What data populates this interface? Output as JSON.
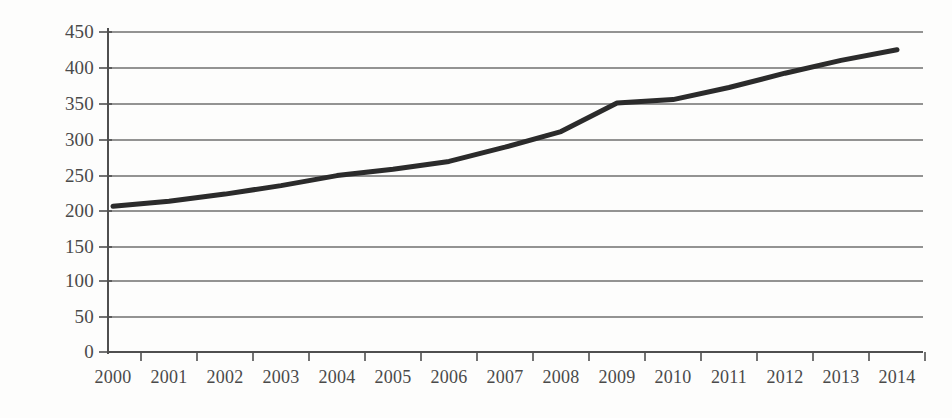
{
  "chart_data": {
    "type": "line",
    "title": "",
    "subtitle": "",
    "xlabel": "",
    "ylabel": "",
    "categories": [
      "2000",
      "2001",
      "2002",
      "2003",
      "2004",
      "2005",
      "2006",
      "2007",
      "2008",
      "2009",
      "2010",
      "2011",
      "2012",
      "2013",
      "2014"
    ],
    "values": [
      205,
      212,
      222,
      234,
      248,
      257,
      268,
      288,
      310,
      350,
      355,
      372,
      392,
      410,
      425
    ],
    "series": [
      {
        "name": "",
        "values": [
          205,
          212,
          222,
          234,
          248,
          257,
          268,
          288,
          310,
          350,
          355,
          372,
          392,
          410,
          425
        ]
      }
    ],
    "ylim": [
      0,
      450
    ],
    "ytick_values": [
      0,
      50,
      100,
      150,
      200,
      250,
      300,
      350,
      400,
      450
    ],
    "ytick_labels": [
      "0",
      "50",
      "100",
      "150",
      "200",
      "250",
      "300",
      "350",
      "400",
      "450"
    ],
    "xtick_labels": [
      "2000",
      "2001",
      "2002",
      "2003",
      "2004",
      "2005",
      "2006",
      "2007",
      "2008",
      "2009",
      "2010",
      "2011",
      "2012",
      "2013",
      "2014"
    ],
    "grid": {
      "horizontal": true,
      "vertical": false
    },
    "legend": {
      "visible": false,
      "position": "none",
      "entries": []
    },
    "annotations": [],
    "colors": {
      "line": "#2b2b2b",
      "grid": "#808080",
      "axis": "#555555",
      "tick_label": "#4a4a4a",
      "background": "#fdfdfc"
    },
    "line_width": 5,
    "markers": false
  }
}
